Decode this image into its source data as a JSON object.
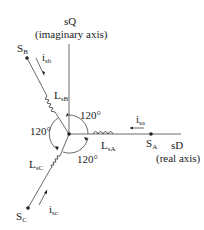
{
  "axes": {
    "q_label": "sQ",
    "q_desc": "(imaginary axis)",
    "d_label": "sD",
    "d_desc": "(real axis)"
  },
  "nodes": {
    "a": {
      "main": "S",
      "sub": "A"
    },
    "b": {
      "main": "S",
      "sub": "B"
    },
    "c": {
      "main": "S",
      "sub": "C"
    }
  },
  "inductors": {
    "a": {
      "main": "L",
      "sub": "sA"
    },
    "b": {
      "main": "L",
      "sub": "sB"
    },
    "c": {
      "main": "L",
      "sub": "sC"
    }
  },
  "currents": {
    "a": {
      "main": "i",
      "sub": "sa"
    },
    "b": {
      "main": "i",
      "sub": "sb"
    },
    "c": {
      "main": "i",
      "sub": "sc"
    }
  },
  "angles": {
    "top": "120°",
    "left": "120°",
    "bottom": "120°"
  },
  "colors": {
    "line": "#333333",
    "text": "#222222"
  }
}
